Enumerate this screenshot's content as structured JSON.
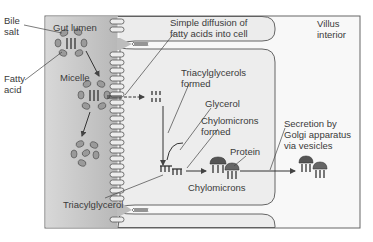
{
  "diagram": {
    "regions": {
      "gut_lumen": "Gut lumen",
      "villus_interior": "Villus\ninterior"
    },
    "labels": {
      "bile_salt": "Bile\nsalt",
      "fatty_acid": "Fatty\nacid",
      "micelle": "Micelle",
      "simple_diffusion": "Simple diffusion of\nfatty acids into cell",
      "triacylglycerols_formed": "Triacylglycerols\nformed",
      "glycerol": "Glycerol",
      "chylomicrons_formed": "Chylomicrons\nformed",
      "protein": "Protein",
      "chylomicrons": "Chylomicrons",
      "secretion": "Secretion by\nGolgi apparatus\nvia vesicles",
      "triacylglycerol": "Triacylglycerol"
    },
    "colors": {
      "lumen_fill": "#c9c9c9",
      "cell_fill": "#f0f0f0",
      "villus_fill": "#f7f7f7",
      "line": "#4a4a4a",
      "text": "#3a3a3a",
      "chylomicron": "#555555"
    }
  }
}
